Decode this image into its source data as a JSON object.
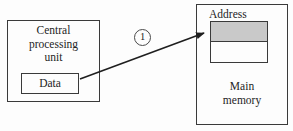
{
  "diagram": {
    "cpu": {
      "label": "Central processing unit",
      "register_label": "Data"
    },
    "memory": {
      "address_label": "Address",
      "label": "Main memory"
    },
    "arrow": {
      "step_label": "1"
    }
  },
  "colors": {
    "shaded_cell": "#c9c9c9",
    "line": "#1f1f1f",
    "background": "#fdfdfd"
  }
}
